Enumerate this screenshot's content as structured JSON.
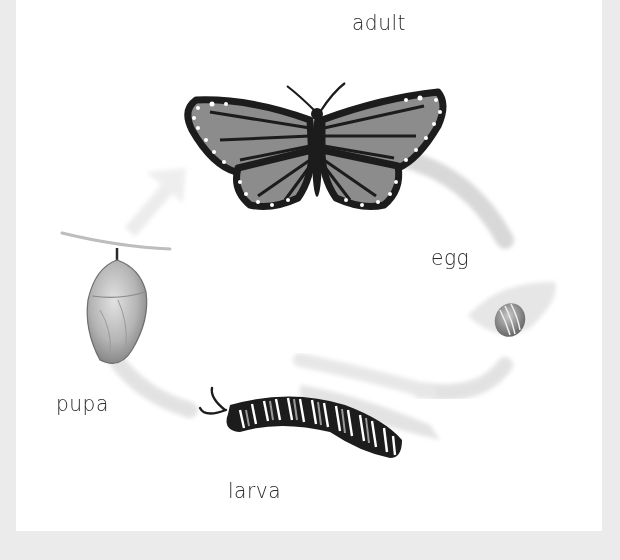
{
  "diagram": {
    "type": "life-cycle",
    "stages": [
      {
        "id": "adult",
        "label": "adult"
      },
      {
        "id": "egg",
        "label": "egg"
      },
      {
        "id": "larva",
        "label": "larva"
      },
      {
        "id": "pupa",
        "label": "pupa"
      }
    ],
    "cycle_direction": "clockwise",
    "arrow_color": "#d9d9d9",
    "colors": {
      "background": "#ebebeb",
      "panel": "#ffffff",
      "outline": "#1c1c1c",
      "wing_fill": "#8c8c8c",
      "text": "#2a2a2a"
    }
  }
}
